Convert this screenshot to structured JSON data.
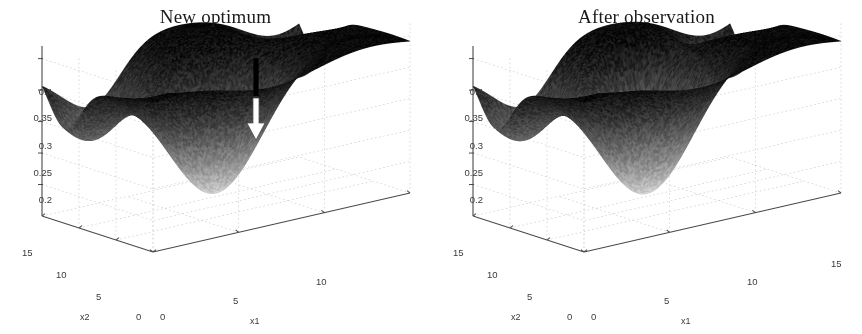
{
  "figure": {
    "background": "#ffffff",
    "width": 862,
    "height": 334,
    "panel_count": 2
  },
  "panels": [
    {
      "id": "left",
      "title": "New optimum",
      "arrow": {
        "name": "down-arrow-annotation",
        "shaft_color": "#000000",
        "head_color": "#ffffff",
        "head_outline": "#555555",
        "x": 256,
        "shaft_top": 58,
        "shaft_bottom": 96,
        "head_top": 98,
        "head_bottom": 140,
        "points_to": "high dark ridge region"
      }
    },
    {
      "id": "right",
      "title": "After observation",
      "arrow": {
        "name": "down-arrow-annotation",
        "shaft_color": "#000000",
        "head_color": "#ffffff",
        "head_outline": "#555555",
        "x": 687,
        "shaft_top": 56,
        "shaft_bottom": 112,
        "head_top": 112,
        "head_bottom": 158,
        "points_to": "new bright depression carved by observation"
      }
    }
  ],
  "chart_data": {
    "type": "surface",
    "count": 2,
    "colormap": "gray-inverted",
    "colormap_note": "dark = high value (ridges), bright/white = low value (valleys)",
    "shared": {
      "xlabel": "x1",
      "ylabel": "x2",
      "zlabel": "",
      "xlim": [
        0,
        15
      ],
      "ylim": [
        0,
        15
      ],
      "zlim": [
        0.15,
        0.42
      ],
      "xticks": [
        0,
        5,
        10,
        15
      ],
      "yticks": [
        0,
        5,
        10,
        15
      ],
      "zticks": [
        0.2,
        0.25,
        0.3,
        0.35,
        0.4
      ],
      "ztick_labels": [
        "0.2",
        "0.25",
        "0.3",
        "0.35",
        "0.4"
      ],
      "xtick_labels": [
        "0",
        "5",
        "10",
        "15"
      ],
      "ytick_labels": [
        "0",
        "5",
        "10",
        "15"
      ],
      "grid": true,
      "grid_style": "dotted",
      "legend": false,
      "view": {
        "azimuth": -37.5,
        "elevation": 26
      }
    },
    "surfaces": [
      {
        "name": "New optimum",
        "title": "New optimum",
        "zmin": 0.17,
        "zmax": 0.41,
        "plateau_level": 0.4,
        "minima": [
          {
            "x1": 1.6,
            "x2": 11.8,
            "z": 0.285,
            "radius": 2.1
          },
          {
            "x1": 6.3,
            "x2": 6.0,
            "z": 0.175,
            "radius": 2.6
          },
          {
            "x1": 13.6,
            "x2": 12.4,
            "z": 0.295,
            "radius": 1.8
          },
          {
            "x1": 3.2,
            "x2": 14.2,
            "z": 0.335,
            "radius": 1.5
          }
        ],
        "ridges": [
          {
            "x1": 7.5,
            "x2": 13.0,
            "z": 0.405
          },
          {
            "x1": 12.0,
            "x2": 4.0,
            "z": 0.395
          }
        ],
        "annotation_target": {
          "x1": 7.6,
          "x2": 12.4,
          "z": 0.4
        }
      },
      {
        "name": "After observation",
        "title": "After observation",
        "zmin": 0.17,
        "zmax": 0.41,
        "plateau_level": 0.4,
        "minima": [
          {
            "x1": 1.6,
            "x2": 11.8,
            "z": 0.285,
            "radius": 2.1
          },
          {
            "x1": 6.3,
            "x2": 6.0,
            "z": 0.175,
            "radius": 2.6
          },
          {
            "x1": 13.6,
            "x2": 12.4,
            "z": 0.295,
            "radius": 1.8
          },
          {
            "x1": 3.2,
            "x2": 14.2,
            "z": 0.335,
            "radius": 1.5
          },
          {
            "x1": 7.8,
            "x2": 10.4,
            "z": 0.255,
            "radius": 1.35
          }
        ],
        "ridges": [
          {
            "x1": 7.5,
            "x2": 13.6,
            "z": 0.405
          },
          {
            "x1": 12.0,
            "x2": 4.0,
            "z": 0.395
          }
        ],
        "annotation_target": {
          "x1": 7.8,
          "x2": 10.4,
          "z": 0.255
        },
        "new_feature": "depression at arrow location"
      }
    ]
  },
  "axis_labels": {
    "x1": "x1",
    "x2": "x2"
  },
  "ticks": {
    "left": {
      "z": [
        "0.4",
        "0.35",
        "0.3",
        "0.25",
        "0.2"
      ],
      "x2": [
        "15",
        "10",
        "5",
        "0"
      ],
      "x1": [
        "0",
        "5",
        "10"
      ]
    },
    "right": {
      "z": [
        "0.4",
        "0.35",
        "0.3",
        "0.25",
        "0.2"
      ],
      "x2": [
        "15",
        "10",
        "5",
        "0"
      ],
      "x1": [
        "0",
        "5",
        "10",
        "15"
      ]
    }
  }
}
